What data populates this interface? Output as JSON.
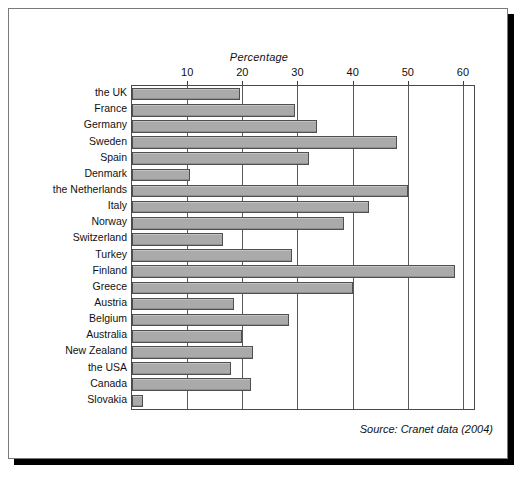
{
  "figure": {
    "source_note": "Source: Cranet data (2004)",
    "bar_fill_color": "#aaaaaa",
    "bar_border_color": "#4f4f4f",
    "frame_border_color": "#7a7a7a",
    "shadow_color": "#000000"
  },
  "chart_data": {
    "type": "bar",
    "orientation": "horizontal",
    "title": "",
    "xlabel": "Percentage",
    "ylabel": "",
    "xlim": [
      0,
      62
    ],
    "grid": true,
    "legend": "none",
    "xticks": [
      10,
      20,
      30,
      40,
      50,
      60
    ],
    "xtick_labels": [
      "10",
      "20",
      "30",
      "40",
      "50",
      "60"
    ],
    "categories": [
      "the UK",
      "France",
      "Germany",
      "Sweden",
      "Spain",
      "Denmark",
      "the Netherlands",
      "Italy",
      "Norway",
      "Switzerland",
      "Turkey",
      "Finland",
      "Greece",
      "Austria",
      "Belgium",
      "Australia",
      "New Zealand",
      "the USA",
      "Canada",
      "Slovakia"
    ],
    "values": [
      19.5,
      29.5,
      33.5,
      48,
      32,
      10.5,
      50,
      43,
      38.5,
      16.5,
      29,
      58.5,
      40,
      18.5,
      28.5,
      20,
      22,
      18,
      21.5,
      2
    ],
    "annotations": [
      "Source: Cranet data (2004)"
    ]
  }
}
